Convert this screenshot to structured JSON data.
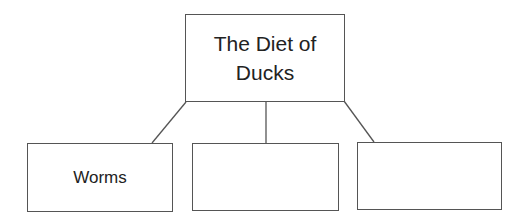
{
  "diagram": {
    "type": "tree",
    "root": {
      "label": "The Diet of Ducks"
    },
    "children": [
      {
        "label": "Worms"
      },
      {
        "label": ""
      },
      {
        "label": ""
      }
    ],
    "line_color": "#555555"
  }
}
